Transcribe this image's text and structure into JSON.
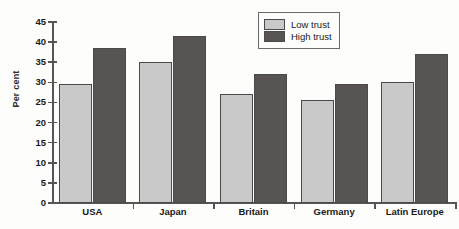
{
  "chart_data": {
    "type": "bar",
    "title": "",
    "xlabel": "",
    "ylabel": "Per cent",
    "categories": [
      "USA",
      "Japan",
      "Britain",
      "Germany",
      "Latin Europe"
    ],
    "series": [
      {
        "name": "Low trust",
        "color": "#c9c9c9",
        "values": [
          29.5,
          35.0,
          27.0,
          25.5,
          30.0
        ]
      },
      {
        "name": "High trust",
        "color": "#585452",
        "values": [
          38.5,
          41.5,
          32.0,
          29.5,
          37.0
        ]
      }
    ],
    "ylim": [
      0,
      45
    ],
    "ytick_step": 5,
    "ytick_labels": [
      "0",
      "5",
      "10",
      "15",
      "20",
      "25",
      "30",
      "35",
      "40",
      "45"
    ],
    "grid": false,
    "legend_position": "top-right"
  },
  "legend": {
    "entries": [
      {
        "label": "Low trust"
      },
      {
        "label": "High trust"
      }
    ]
  },
  "colors": {
    "low_trust": "#c9c9c9",
    "high_trust": "#585452",
    "axis": "#555555",
    "background": "#fdfdfb"
  }
}
